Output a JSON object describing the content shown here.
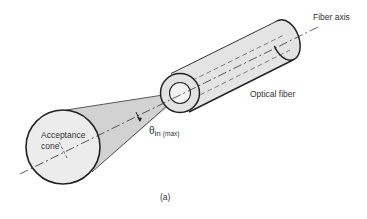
{
  "figure": {
    "caption": "(a)",
    "labels": {
      "fiber_axis": "Fiber axis",
      "optical_fiber": "Optical fiber",
      "theta_symbol": "θ",
      "theta_sub": "in",
      "theta_qualifier": "(max)",
      "acceptance_line1": "Acceptance",
      "acceptance_line2": "cone"
    },
    "colors": {
      "stroke": "#222222",
      "cone_fill": "#d4d4d4",
      "fiber_fill": "#e6e6e6",
      "circle_fill": "#eeeeee",
      "text": "#333333"
    }
  }
}
